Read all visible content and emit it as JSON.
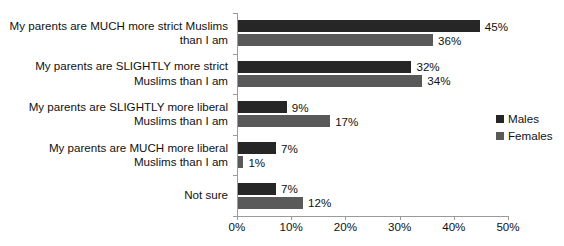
{
  "chart_data": {
    "type": "bar",
    "orientation": "horizontal",
    "title": "",
    "xlabel": "",
    "ylabel": "",
    "xlim": [
      0,
      50
    ],
    "xticks": [
      "0%",
      "10%",
      "20%",
      "30%",
      "40%",
      "50%"
    ],
    "xtick_values": [
      0,
      10,
      20,
      30,
      40,
      50
    ],
    "grid": false,
    "legend_position": "right",
    "categories": [
      "My parents are MUCH more strict Muslims than I am",
      "My parents are SLIGHTLY more strict Muslims than I am",
      "My parents are SLIGHTLY more liberal Muslims than I am",
      "My parents are MUCH more liberal Muslims than I am",
      "Not sure"
    ],
    "category_lines": [
      [
        "My parents are MUCH more strict Muslims",
        "than I am"
      ],
      [
        "My parents are SLIGHTLY more strict",
        "Muslims than I am"
      ],
      [
        "My parents are SLIGHTLY more liberal",
        "Muslims than I am"
      ],
      [
        "My parents are MUCH more liberal",
        "Muslims than I am"
      ],
      [
        "Not sure"
      ]
    ],
    "series": [
      {
        "name": "Males",
        "color": "#262626",
        "values": [
          45,
          32,
          9,
          7,
          7
        ],
        "labels": [
          "45%",
          "32%",
          "9%",
          "7%",
          "7%"
        ]
      },
      {
        "name": "Females",
        "color": "#595959",
        "values": [
          36,
          34,
          17,
          1,
          12
        ],
        "labels": [
          "36%",
          "34%",
          "17%",
          "1%",
          "12%"
        ]
      }
    ]
  },
  "legend": {
    "items": [
      {
        "label": "Males",
        "color": "#262626"
      },
      {
        "label": "Females",
        "color": "#595959"
      }
    ]
  }
}
